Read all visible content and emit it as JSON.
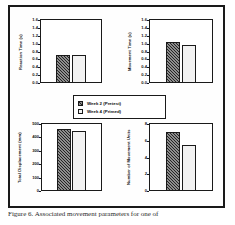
{
  "figure": {
    "caption": "Figure 6. Associated movement parameters for one of",
    "border_color": "#1a1a1a",
    "background": "#ffffff"
  },
  "legend": {
    "position": "center",
    "entries": [
      {
        "label": "Week 2  (Pretest)",
        "fill": "#8d8d8d",
        "pattern": "diagonal-hatch"
      },
      {
        "label": "Week 4  (Primed)",
        "fill": "#f2f2f2",
        "pattern": "dotted-grid"
      }
    ]
  },
  "chart_data": [
    {
      "type": "bar",
      "id": "reaction-time",
      "title": "",
      "ylabel": "Reaction Time (s)",
      "xlabel": "",
      "categories": [
        "Week 2 (Pretest)",
        "Week 4 (Primed)"
      ],
      "values": [
        0.72,
        0.7
      ],
      "ylim": [
        0.0,
        1.6
      ],
      "yticks": [
        "0.0",
        "0.2",
        "0.4",
        "0.6",
        "0.8",
        "1.0",
        "1.2",
        "1.4",
        "1.6"
      ],
      "grid": false
    },
    {
      "type": "bar",
      "id": "movement-time",
      "title": "",
      "ylabel": "Movement Time (s)",
      "xlabel": "",
      "categories": [
        "Week 2 (Pretest)",
        "Week 4 (Primed)"
      ],
      "values": [
        1.03,
        0.96
      ],
      "ylim": [
        0.0,
        1.6
      ],
      "yticks": [
        "0.0",
        "0.2",
        "0.4",
        "0.6",
        "0.8",
        "1.0",
        "1.2",
        "1.4",
        "1.6"
      ],
      "grid": false
    },
    {
      "type": "bar",
      "id": "total-displacement",
      "title": "",
      "ylabel": "Total Displacement (mm)",
      "xlabel": "",
      "categories": [
        "Week 2 (Pretest)",
        "Week 4 (Primed)"
      ],
      "values": [
        465,
        445
      ],
      "ylim": [
        0,
        500
      ],
      "yticks": [
        "0",
        "100",
        "200",
        "300",
        "400",
        "500"
      ],
      "grid": false
    },
    {
      "type": "bar",
      "id": "movement-units",
      "title": "",
      "ylabel": "Number of Movement Units",
      "xlabel": "",
      "categories": [
        "Week 2 (Pretest)",
        "Week 4 (Primed)"
      ],
      "values": [
        7.0,
        5.5
      ],
      "ylim": [
        0,
        8
      ],
      "yticks": [
        "0",
        "2",
        "4",
        "6",
        "8"
      ],
      "grid": false
    }
  ]
}
